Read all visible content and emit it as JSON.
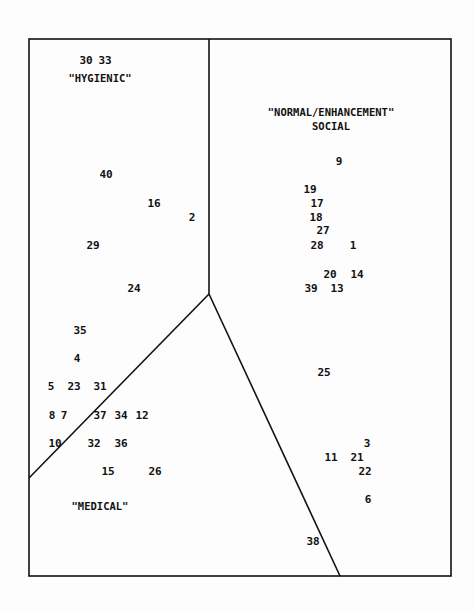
{
  "diagram": {
    "type": "partitioned-scatter",
    "border": {
      "left": 29,
      "top": 39,
      "right": 451,
      "bottom": 576
    },
    "dividers": [
      {
        "name": "vertical",
        "x1": 209,
        "y1": 39,
        "x2": 209,
        "y2": 294
      },
      {
        "name": "left-diagonal",
        "x1": 209,
        "y1": 294,
        "x2": 29,
        "y2": 478
      },
      {
        "name": "right-diagonal",
        "x1": 209,
        "y1": 294,
        "x2": 340,
        "y2": 576
      }
    ],
    "regions": [
      {
        "label": "\"HYGIENIC\"",
        "x": 100,
        "y": 78
      },
      {
        "label": "\"NORMAL/ENHANCEMENT\"",
        "label2": "SOCIAL",
        "x": 331,
        "y": 112
      },
      {
        "label": "\"MEDICAL\"",
        "x": 100,
        "y": 506
      }
    ],
    "points": [
      {
        "id": "30",
        "x": 86,
        "y": 60
      },
      {
        "id": "33",
        "x": 105,
        "y": 60
      },
      {
        "id": "40",
        "x": 106,
        "y": 174
      },
      {
        "id": "16",
        "x": 154,
        "y": 203
      },
      {
        "id": "2",
        "x": 192,
        "y": 217
      },
      {
        "id": "29",
        "x": 93,
        "y": 245
      },
      {
        "id": "24",
        "x": 134,
        "y": 288
      },
      {
        "id": "9",
        "x": 339,
        "y": 161
      },
      {
        "id": "19",
        "x": 310,
        "y": 189
      },
      {
        "id": "17",
        "x": 317,
        "y": 203
      },
      {
        "id": "18",
        "x": 316,
        "y": 217
      },
      {
        "id": "27",
        "x": 323,
        "y": 230
      },
      {
        "id": "28",
        "x": 317,
        "y": 245
      },
      {
        "id": "1",
        "x": 353,
        "y": 245
      },
      {
        "id": "20",
        "x": 330,
        "y": 274
      },
      {
        "id": "14",
        "x": 357,
        "y": 274
      },
      {
        "id": "39",
        "x": 311,
        "y": 288
      },
      {
        "id": "13",
        "x": 337,
        "y": 288
      },
      {
        "id": "35",
        "x": 80,
        "y": 330
      },
      {
        "id": "4",
        "x": 77,
        "y": 358
      },
      {
        "id": "5",
        "x": 51,
        "y": 386
      },
      {
        "id": "23",
        "x": 74,
        "y": 386
      },
      {
        "id": "31",
        "x": 100,
        "y": 386
      },
      {
        "id": "8",
        "x": 52,
        "y": 415
      },
      {
        "id": "7",
        "x": 64,
        "y": 415
      },
      {
        "id": "37",
        "x": 100,
        "y": 415
      },
      {
        "id": "34",
        "x": 121,
        "y": 415
      },
      {
        "id": "12",
        "x": 142,
        "y": 415
      },
      {
        "id": "10",
        "x": 55,
        "y": 443
      },
      {
        "id": "32",
        "x": 94,
        "y": 443
      },
      {
        "id": "36",
        "x": 121,
        "y": 443
      },
      {
        "id": "15",
        "x": 108,
        "y": 471
      },
      {
        "id": "26",
        "x": 155,
        "y": 471
      },
      {
        "id": "25",
        "x": 324,
        "y": 372
      },
      {
        "id": "3",
        "x": 367,
        "y": 443
      },
      {
        "id": "11",
        "x": 331,
        "y": 457
      },
      {
        "id": "21",
        "x": 357,
        "y": 457
      },
      {
        "id": "22",
        "x": 365,
        "y": 471
      },
      {
        "id": "6",
        "x": 368,
        "y": 499
      },
      {
        "id": "38",
        "x": 313,
        "y": 541
      }
    ]
  }
}
